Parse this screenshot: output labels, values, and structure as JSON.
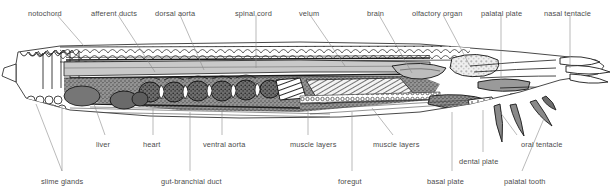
{
  "figure": {
    "background_color": "#ffffff",
    "label_color": "#4d4d4d",
    "leader_color": "#8c8c8c",
    "ink_color": "#1a1a1a",
    "width": 616,
    "height": 195
  },
  "labels": {
    "top": [
      {
        "id": "notochord",
        "text": "notochord",
        "x": 28,
        "y": 9,
        "anchor": "start"
      },
      {
        "id": "afferent_ducts",
        "text": "afferent ducts",
        "x": 91,
        "y": 9,
        "anchor": "start"
      },
      {
        "id": "dorsal_aorta",
        "text": "dorsal aorta",
        "x": 155,
        "y": 9,
        "anchor": "start"
      },
      {
        "id": "spinal_cord",
        "text": "spinal cord",
        "x": 235,
        "y": 9,
        "anchor": "start"
      },
      {
        "id": "velum",
        "text": "velum",
        "x": 299,
        "y": 9,
        "anchor": "start"
      },
      {
        "id": "brain",
        "text": "brain",
        "x": 367,
        "y": 9,
        "anchor": "start"
      },
      {
        "id": "olfactory_organ",
        "text": "olfactory organ",
        "x": 412,
        "y": 9,
        "anchor": "start"
      },
      {
        "id": "palatal_plate",
        "text": "palatal plate",
        "x": 481,
        "y": 9,
        "anchor": "start"
      },
      {
        "id": "nasal_tentacle",
        "text": "nasal tentacle",
        "x": 544,
        "y": 9,
        "anchor": "start"
      }
    ],
    "bottom_upper": [
      {
        "id": "liver",
        "text": "liver",
        "x": 96,
        "y": 140,
        "anchor": "start"
      },
      {
        "id": "heart",
        "text": "heart",
        "x": 143,
        "y": 140,
        "anchor": "start"
      },
      {
        "id": "ventral_aorta",
        "text": "ventral aorta",
        "x": 203,
        "y": 140,
        "anchor": "start"
      },
      {
        "id": "muscle_layers_1",
        "text": "muscle layers",
        "x": 290,
        "y": 140,
        "anchor": "start"
      },
      {
        "id": "muscle_layers_2",
        "text": "muscle layers",
        "x": 373,
        "y": 140,
        "anchor": "start"
      },
      {
        "id": "oral_tentacle",
        "text": "oral tentacle",
        "x": 521,
        "y": 140,
        "anchor": "start"
      }
    ],
    "bottom_mid": [
      {
        "id": "dental_plate",
        "text": "dental plate",
        "x": 459,
        "y": 157,
        "anchor": "start"
      }
    ],
    "bottom_lower": [
      {
        "id": "slime_glands",
        "text": "slime glands",
        "x": 41,
        "y": 177,
        "anchor": "start"
      },
      {
        "id": "gut_branchial_duct",
        "text": "gut-branchial duct",
        "x": 161,
        "y": 177,
        "anchor": "start"
      },
      {
        "id": "foregut",
        "text": "foregut",
        "x": 338,
        "y": 177,
        "anchor": "start"
      },
      {
        "id": "basal_plate",
        "text": "basal plate",
        "x": 427,
        "y": 177,
        "anchor": "start"
      },
      {
        "id": "palatal_tooth",
        "text": "palatal tooth",
        "x": 504,
        "y": 177,
        "anchor": "start"
      }
    ]
  },
  "leaders": {
    "top": [
      {
        "id": "notochord",
        "points": "57,15 84,46"
      },
      {
        "id": "afferent_ducts",
        "points": "118,15 155,72"
      },
      {
        "id": "dorsal_aorta",
        "points": "180,15 204,70"
      },
      {
        "id": "spinal_cord",
        "points": "256,15 256,68"
      },
      {
        "id": "velum",
        "points": "310,15 345,66"
      },
      {
        "id": "brain",
        "points": "379,15 412,73"
      },
      {
        "id": "olfactory_organ",
        "points": "443,15 470,66"
      },
      {
        "id": "palatal_plate",
        "points": "501,15 501,80"
      },
      {
        "id": "nasal_tentacle",
        "points": "570,15 570,68"
      }
    ],
    "bottom": [
      {
        "id": "liver",
        "points": "105,135 94,104"
      },
      {
        "id": "heart",
        "points": "153,135 153,108"
      },
      {
        "id": "ventral_aorta",
        "points": "222,135 222,108"
      },
      {
        "id": "muscle_layers_1",
        "points": "308,135 308,106"
      },
      {
        "id": "muscle_layers_2",
        "points": "393,135 372,108"
      },
      {
        "id": "oral_tentacle",
        "points": "517,135 500,112"
      },
      {
        "id": "dental_plate",
        "points": "483,152 483,110"
      },
      {
        "id": "slime_glands_a",
        "points": "62,171 36,104"
      },
      {
        "id": "slime_glands_b",
        "points": "62,171 62,104"
      },
      {
        "id": "gut_branchial_a",
        "points": "190,171 190,112"
      },
      {
        "id": "foregut",
        "points": "352,171 352,112"
      },
      {
        "id": "basal_plate",
        "points": "452,171 452,112"
      },
      {
        "id": "palatal_tooth",
        "points": "522,171 545,116"
      }
    ]
  }
}
